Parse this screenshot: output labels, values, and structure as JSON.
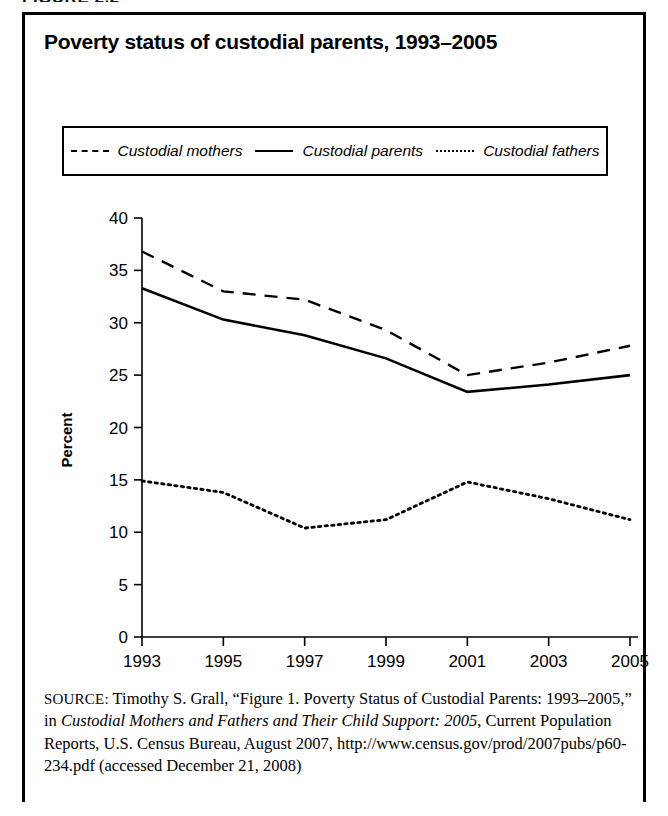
{
  "figure": {
    "number_label": "FIGURE 2.2",
    "title": "Poverty status of custodial parents, 1993–2005"
  },
  "legend": {
    "items": [
      {
        "label": "Custodial mothers",
        "style": "dashed",
        "name": "legend-custodial-mothers"
      },
      {
        "label": "Custodial parents",
        "style": "solid",
        "name": "legend-custodial-parents"
      },
      {
        "label": "Custodial fathers",
        "style": "dotted",
        "name": "legend-custodial-fathers"
      }
    ]
  },
  "axes": {
    "y_title": "Percent",
    "y_ticks": [
      "40",
      "35",
      "30",
      "25",
      "20",
      "15",
      "10",
      "5",
      "0"
    ],
    "x_ticks": [
      "1993",
      "1995",
      "1997",
      "1999",
      "2001",
      "2003",
      "2005"
    ]
  },
  "source": {
    "label": "SOURCE:",
    "line1": " Timothy S. Grall, “Figure 1. Poverty Status of Custodial",
    "line2_pre": "Parents: 1993–2005,” in ",
    "line2_ital": "Custodial Mothers and Fathers and Their",
    "line3_ital": "Child Support: 2005",
    "line3_post": ", Current Population Reports, U.S. Census Bureau,",
    "line4": "August 2007, http://www.census.gov/prod/2007pubs/p60-234.pdf",
    "line5": "(accessed December 21, 2008)"
  },
  "chart_data": {
    "type": "line",
    "title": "Poverty status of custodial parents, 1993–2005",
    "xlabel": "",
    "ylabel": "Percent",
    "x": [
      1993,
      1995,
      1997,
      1999,
      2001,
      2003,
      2005
    ],
    "xlim": [
      1993,
      2005
    ],
    "ylim": [
      0,
      40
    ],
    "ytick_step": 5,
    "grid": false,
    "legend_position": "top",
    "series": [
      {
        "name": "Custodial mothers",
        "style": "dashed",
        "values": [
          36.8,
          33.0,
          32.2,
          29.3,
          25.0,
          26.2,
          27.8
        ]
      },
      {
        "name": "Custodial parents",
        "style": "solid",
        "values": [
          33.3,
          30.3,
          28.8,
          26.6,
          23.4,
          24.1,
          25.0
        ]
      },
      {
        "name": "Custodial fathers",
        "style": "dotted",
        "values": [
          14.9,
          13.8,
          10.4,
          11.2,
          14.8,
          13.2,
          11.2
        ]
      }
    ]
  }
}
